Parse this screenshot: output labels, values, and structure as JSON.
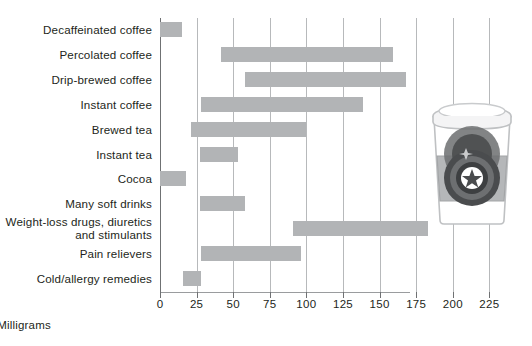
{
  "chart_data": {
    "type": "bar",
    "orientation": "horizontal",
    "title": "",
    "xlabel": "Milligrams",
    "ylabel": "",
    "xlim": [
      0,
      230
    ],
    "grid": true,
    "legend": "none",
    "xticks": [
      0,
      25,
      50,
      75,
      100,
      125,
      150,
      175,
      200,
      225
    ],
    "xtick_labels": [
      "0",
      "25",
      "50",
      "75",
      "100",
      "125",
      "150",
      "175",
      "200",
      "225"
    ],
    "bar_color": "#b2b4b6",
    "categories": [
      "Decaffeinated coffee",
      "Percolated coffee",
      "Drip-brewed coffee",
      "Instant coffee",
      "Brewed tea",
      "Instant tea",
      "Cocoa",
      "Many soft drinks",
      "Weight-loss drugs, diuretics\nand stimulants",
      "Pain relievers",
      "Cold/allergy remedies"
    ],
    "ranges": [
      {
        "category": "Decaffeinated coffee",
        "low": 0,
        "high": 15
      },
      {
        "category": "Percolated coffee",
        "low": 42,
        "high": 159
      },
      {
        "category": "Drip-brewed coffee",
        "low": 58,
        "high": 168
      },
      {
        "category": "Instant coffee",
        "low": 28,
        "high": 139
      },
      {
        "category": "Brewed tea",
        "low": 21,
        "high": 100
      },
      {
        "category": "Instant tea",
        "low": 27,
        "high": 53
      },
      {
        "category": "Cocoa",
        "low": 0,
        "high": 18
      },
      {
        "category": "Many soft drinks",
        "low": 27,
        "high": 58
      },
      {
        "category": "Weight-loss drugs, diuretics and stimulants",
        "low": 91,
        "high": 183
      },
      {
        "category": "Pain relievers",
        "low": 28,
        "high": 96
      },
      {
        "category": "Cold/allergy remedies",
        "low": 16,
        "high": 28
      }
    ]
  },
  "illustration": {
    "name": "coffee-cup",
    "description": "paper coffee cup with lid, sleeve and star emblem"
  }
}
